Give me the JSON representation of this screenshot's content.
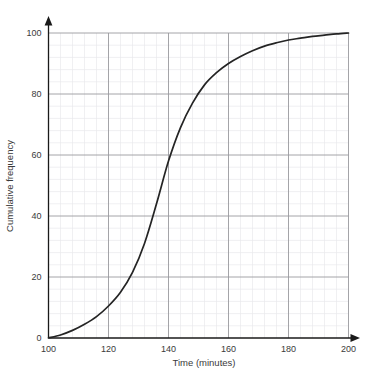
{
  "chart_data": {
    "type": "line",
    "title": "",
    "subtitle": "",
    "xlabel": "Time (minutes)",
    "ylabel": "Cumulative frequency",
    "xlim": [
      100,
      200
    ],
    "ylim": [
      0,
      100
    ],
    "x_ticks": [
      100,
      120,
      140,
      160,
      180,
      200
    ],
    "x_tick_labels": [
      "100",
      "120",
      "140",
      "160",
      "180",
      "200"
    ],
    "y_ticks": [
      0,
      20,
      40,
      60,
      80,
      100
    ],
    "y_tick_labels": [
      "0",
      "20",
      "40",
      "60",
      "80",
      "100"
    ],
    "x_minor_step": 4,
    "y_minor_step": 4,
    "grid": true,
    "grid_major_color": "#9a9a9e",
    "grid_minor_color": "#e9e9ec",
    "axis_color": "#1a1a1a",
    "curve_color": "#242424",
    "legend": null,
    "legend_position": "none",
    "series": [
      {
        "name": "Cumulative frequency",
        "x": [
          100,
          104,
          108,
          112,
          116,
          120,
          124,
          128,
          132,
          136,
          140,
          144,
          148,
          152,
          156,
          160,
          164,
          168,
          172,
          176,
          180,
          184,
          188,
          192,
          196,
          200
        ],
        "values": [
          0,
          1,
          2.5,
          4.5,
          7,
          10.5,
          15,
          21.5,
          31,
          44,
          58,
          69,
          77,
          83,
          87,
          90,
          92.3,
          94.2,
          95.7,
          96.8,
          97.7,
          98.3,
          98.9,
          99.3,
          99.7,
          100
        ]
      }
    ]
  },
  "axis_titles": {
    "x": "Time (minutes)",
    "y": "Cumulative frequency"
  }
}
